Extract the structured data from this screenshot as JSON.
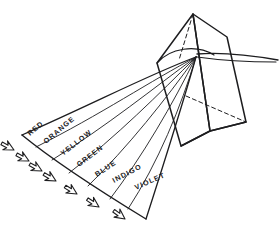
{
  "figure": {
    "style": "hand-drawn pen sketch",
    "background_color": "#ffffff",
    "ink_color": "#1d1d1f"
  },
  "prism": {
    "name": "triangular-prism",
    "apex": [
      193,
      14
    ],
    "front_face": [
      [
        193,
        14
      ],
      [
        157,
        63
      ],
      [
        181,
        146
      ],
      [
        210,
        131
      ]
    ],
    "right_face": [
      [
        193,
        14
      ],
      [
        227,
        37
      ],
      [
        246,
        122
      ],
      [
        210,
        131
      ]
    ],
    "visible_outline": [
      [
        193,
        14
      ],
      [
        157,
        63
      ],
      [
        181,
        146
      ],
      [
        210,
        131
      ],
      [
        246,
        122
      ],
      [
        227,
        37
      ]
    ],
    "hidden_edges": [
      {
        "from": [
          193,
          14
        ],
        "to": [
          178,
          62
        ],
        "dashed": true
      },
      {
        "from": [
          190,
          97
        ],
        "to": [
          246,
          122
        ],
        "dashed": true
      }
    ],
    "base_line": [
      [
        181,
        146
      ],
      [
        210,
        131
      ]
    ]
  },
  "incident_ray": {
    "label": "white-light-ray",
    "from": [
      278,
      59
    ],
    "to": [
      197,
      54
    ],
    "description": "incoming white light entering the prism from the right"
  },
  "refraction_point": [
    196,
    57
  ],
  "spectrum": {
    "fan_origin": [
      196,
      57
    ],
    "bands": [
      {
        "index": 1,
        "label": "RED",
        "color": "#e03127",
        "angle": -42.0,
        "label_x": 43,
        "label_y": 131
      },
      {
        "index": 2,
        "label": "ORANGE",
        "color": "#ef7f1b",
        "angle": -41.0,
        "label_x": 56,
        "label_y": 141
      },
      {
        "index": 3,
        "label": "YELLOW",
        "color": "#f3d417",
        "angle": -38.0,
        "label_x": 72,
        "label_y": 152
      },
      {
        "index": 4,
        "label": "GREEN",
        "color": "#2f9e44",
        "angle": -36.0,
        "label_x": 88,
        "label_y": 163
      },
      {
        "index": 5,
        "label": "BLUE",
        "color": "#1e6fd9",
        "angle": -33.0,
        "label_x": 104,
        "label_y": 173
      },
      {
        "index": 6,
        "label": "INDIGO",
        "color": "#3b2f8f",
        "angle": -28.0,
        "label_x": 123,
        "label_y": 182
      },
      {
        "index": 7,
        "label": "VIOLET",
        "color": "#7d3f98",
        "angle": -24.0,
        "label_x": 143,
        "label_y": 190
      }
    ],
    "band_count": 7
  },
  "arrows": {
    "name": "direction-arrowheads",
    "count": 7,
    "style": "outlined hand-drawn chevron arrowheads pointing down-left",
    "items": [
      {
        "x": 16,
        "y": 150,
        "rot": 208
      },
      {
        "x": 30,
        "y": 160,
        "rot": 208
      },
      {
        "x": 42,
        "y": 170,
        "rot": 208
      },
      {
        "x": 56,
        "y": 180,
        "rot": 210
      },
      {
        "x": 76,
        "y": 193,
        "rot": 212
      },
      {
        "x": 98,
        "y": 206,
        "rot": 214
      },
      {
        "x": 124,
        "y": 218,
        "rot": 216
      }
    ]
  }
}
